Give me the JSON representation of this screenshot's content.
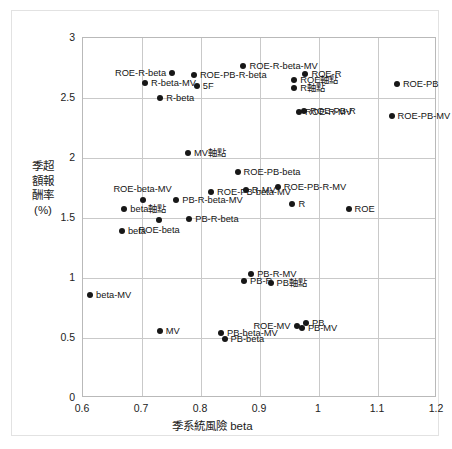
{
  "chart_data": {
    "type": "scatter",
    "title": "",
    "xlabel": "季系統風險 beta",
    "ylabel": "季超額報酬率(%)",
    "xlim": [
      0.6,
      1.2
    ],
    "ylim": [
      0,
      3
    ],
    "xticks": [
      "0.6",
      "0.7",
      "0.8",
      "0.9",
      "1",
      "1.1",
      "1.2"
    ],
    "xtick_values": [
      0.6,
      0.7,
      0.8,
      0.9,
      1.0,
      1.1,
      1.2
    ],
    "yticks": [
      "0",
      "0.5",
      "1",
      "1.5",
      "2",
      "2.5",
      "3"
    ],
    "ytick_values": [
      0,
      0.5,
      1.0,
      1.5,
      2.0,
      2.5,
      3.0
    ],
    "grid": true,
    "legend": "none",
    "series_name": "投資組合",
    "points": [
      {
        "label": "ROE-R-beta",
        "x": 0.751,
        "y": 2.705,
        "anchor": "left"
      },
      {
        "label": "ROE-R-beta-MV",
        "x": 0.872,
        "y": 2.765,
        "anchor": "right"
      },
      {
        "label": "R-beta-MV",
        "x": 0.705,
        "y": 2.625,
        "anchor": "right"
      },
      {
        "label": "ROE-PB-R-beta",
        "x": 0.788,
        "y": 2.69,
        "anchor": "right"
      },
      {
        "label": "5F",
        "x": 0.793,
        "y": 2.6,
        "anchor": "right"
      },
      {
        "label": "R-beta",
        "x": 0.731,
        "y": 2.5,
        "anchor": "right"
      },
      {
        "label": "ROE軸點",
        "x": 0.958,
        "y": 2.65,
        "anchor": "right"
      },
      {
        "label": "R軸點",
        "x": 0.958,
        "y": 2.58,
        "anchor": "right"
      },
      {
        "label": "ROE-R",
        "x": 0.977,
        "y": 2.7,
        "anchor": "right"
      },
      {
        "label": "ROE-PB",
        "x": 1.132,
        "y": 2.62,
        "anchor": "right"
      },
      {
        "label": "ROE-PB-R",
        "x": 0.975,
        "y": 2.395,
        "anchor": "right"
      },
      {
        "label": "ROE-R-MV",
        "x": 0.966,
        "y": 2.383,
        "anchor": "right"
      },
      {
        "label": "ROE-PB-MV",
        "x": 1.123,
        "y": 2.35,
        "anchor": "right"
      },
      {
        "label": "MV軸點",
        "x": 0.778,
        "y": 2.04,
        "anchor": "right"
      },
      {
        "label": "ROE-PB-R-MV",
        "x": 0.93,
        "y": 1.76,
        "anchor": "right"
      },
      {
        "label": "ROE-PB-beta",
        "x": 0.862,
        "y": 1.88,
        "anchor": "right"
      },
      {
        "label": "ROE-PB-beta-MV",
        "x": 0.817,
        "y": 1.713,
        "anchor": "right"
      },
      {
        "label": "R-MV",
        "x": 0.876,
        "y": 1.737,
        "anchor": "right"
      },
      {
        "label": "R",
        "x": 0.955,
        "y": 1.62,
        "anchor": "right"
      },
      {
        "label": "ROE",
        "x": 1.05,
        "y": 1.577,
        "anchor": "right"
      },
      {
        "label": "ROE-beta-MV",
        "x": 0.701,
        "y": 1.648,
        "anchor": "above"
      },
      {
        "label": "PB-R-beta-MV",
        "x": 0.758,
        "y": 1.648,
        "anchor": "right"
      },
      {
        "label": "beta軸點",
        "x": 0.67,
        "y": 1.578,
        "anchor": "right"
      },
      {
        "label": "PB-R-beta",
        "x": 0.78,
        "y": 1.495,
        "anchor": "right"
      },
      {
        "label": "ROE-beta",
        "x": 0.729,
        "y": 1.483,
        "anchor": "below"
      },
      {
        "label": "beta",
        "x": 0.666,
        "y": 1.39,
        "anchor": "right"
      },
      {
        "label": "beta-MV",
        "x": 0.612,
        "y": 0.86,
        "anchor": "right"
      },
      {
        "label": "PB-R-MV",
        "x": 0.885,
        "y": 1.03,
        "anchor": "right"
      },
      {
        "label": "PB-R",
        "x": 0.873,
        "y": 0.975,
        "anchor": "right"
      },
      {
        "label": "PB軸點",
        "x": 0.918,
        "y": 0.96,
        "anchor": "right"
      },
      {
        "label": "MV",
        "x": 0.73,
        "y": 0.56,
        "anchor": "right"
      },
      {
        "label": "ROE-MV",
        "x": 0.962,
        "y": 0.6,
        "anchor": "left"
      },
      {
        "label": "PB",
        "x": 0.978,
        "y": 0.625,
        "anchor": "right"
      },
      {
        "label": "PB-MV",
        "x": 0.971,
        "y": 0.585,
        "anchor": "right"
      },
      {
        "label": "PB-beta-MV",
        "x": 0.834,
        "y": 0.545,
        "anchor": "right"
      },
      {
        "label": "PB-beta",
        "x": 0.84,
        "y": 0.49,
        "anchor": "right"
      }
    ]
  }
}
